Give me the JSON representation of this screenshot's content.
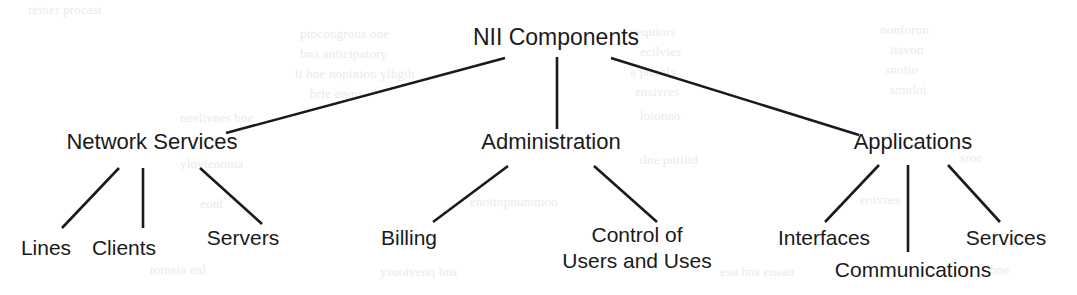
{
  "diagram": {
    "title": "NII Components",
    "type": "tree",
    "orientation": "top-down",
    "background_color": "#ffffff",
    "text_color": "#1a1a1a",
    "edge_color": "#1a1a1a",
    "root": {
      "id": "nii-components",
      "label": "NII Components",
      "x": 556,
      "y": 37
    },
    "branches": [
      {
        "id": "network-services",
        "label": "Network Services",
        "x": 152,
        "y": 142,
        "children": [
          {
            "id": "lines",
            "label": "Lines",
            "x": 46,
            "y": 248
          },
          {
            "id": "clients",
            "label": "Clients",
            "x": 124,
            "y": 248
          },
          {
            "id": "servers",
            "label": "Servers",
            "x": 243,
            "y": 238
          }
        ]
      },
      {
        "id": "administration",
        "label": "Administration",
        "x": 551,
        "y": 142,
        "children": [
          {
            "id": "billing",
            "label": "Billing",
            "x": 409,
            "y": 238
          },
          {
            "id": "control-of-users-and-uses",
            "label": "Control of Users and Uses",
            "lines": [
              "Control of",
              "Users and Uses"
            ],
            "x": 637,
            "y": 248
          }
        ]
      },
      {
        "id": "applications",
        "label": "Applications",
        "x": 913,
        "y": 142,
        "children": [
          {
            "id": "interfaces",
            "label": "Interfaces",
            "x": 824,
            "y": 238
          },
          {
            "id": "communications",
            "label": "Communications",
            "x": 913,
            "y": 270
          },
          {
            "id": "services",
            "label": "Services",
            "x": 1006,
            "y": 238
          }
        ]
      }
    ],
    "edges": [
      {
        "id": "edge-root-network-services",
        "from": "nii-components",
        "to": "network-services",
        "x1": 505,
        "y1": 58,
        "x2": 226,
        "y2": 133
      },
      {
        "id": "edge-root-administration",
        "from": "nii-components",
        "to": "administration",
        "x1": 557,
        "y1": 57,
        "x2": 557,
        "y2": 129
      },
      {
        "id": "edge-root-applications",
        "from": "nii-components",
        "to": "applications",
        "x1": 611,
        "y1": 58,
        "x2": 859,
        "y2": 135
      },
      {
        "id": "edge-network-services-lines",
        "from": "network-services",
        "to": "lines",
        "x1": 119,
        "y1": 168,
        "x2": 62,
        "y2": 228
      },
      {
        "id": "edge-network-services-clients",
        "from": "network-services",
        "to": "clients",
        "x1": 143,
        "y1": 168,
        "x2": 143,
        "y2": 228
      },
      {
        "id": "edge-network-services-servers",
        "from": "network-services",
        "to": "servers",
        "x1": 200,
        "y1": 168,
        "x2": 262,
        "y2": 224
      },
      {
        "id": "edge-administration-billing",
        "from": "administration",
        "to": "billing",
        "x1": 508,
        "y1": 166,
        "x2": 433,
        "y2": 222
      },
      {
        "id": "edge-administration-control",
        "from": "administration",
        "to": "control-of-users-and-uses",
        "x1": 594,
        "y1": 166,
        "x2": 657,
        "y2": 222
      },
      {
        "id": "edge-applications-interfaces",
        "from": "applications",
        "to": "interfaces",
        "x1": 879,
        "y1": 165,
        "x2": 825,
        "y2": 222
      },
      {
        "id": "edge-applications-communications",
        "from": "applications",
        "to": "communications",
        "x1": 908,
        "y1": 165,
        "x2": 908,
        "y2": 252
      },
      {
        "id": "edge-applications-services",
        "from": "applications",
        "to": "services",
        "x1": 948,
        "y1": 165,
        "x2": 1000,
        "y2": 222
      }
    ]
  },
  "background_ghost_text": [
    {
      "text": "reiner procast",
      "x": 28,
      "y": 2
    },
    {
      "text": "ptocongrous one",
      "x": 300,
      "y": 26
    },
    {
      "text": "e nequiors",
      "x": 620,
      "y": 24
    },
    {
      "text": "nonforon",
      "x": 880,
      "y": 22
    },
    {
      "text": "bna anticipatory",
      "x": 300,
      "y": 46
    },
    {
      "text": "ecilvies",
      "x": 640,
      "y": 44
    },
    {
      "text": "itavon",
      "x": 890,
      "y": 42
    },
    {
      "text": "li bne nopinion ylhgih",
      "x": 295,
      "y": 66
    },
    {
      "text": "a pnnoly",
      "x": 630,
      "y": 64
    },
    {
      "text": "snotio",
      "x": 885,
      "y": 62
    },
    {
      "text": "brie enov",
      "x": 310,
      "y": 86
    },
    {
      "text": "ensivres",
      "x": 635,
      "y": 84
    },
    {
      "text": "smuloi",
      "x": 890,
      "y": 82
    },
    {
      "text": "neelivnes bne",
      "x": 180,
      "y": 110
    },
    {
      "text": "loionao",
      "x": 640,
      "y": 108
    },
    {
      "text": "ylovienoma",
      "x": 180,
      "y": 156
    },
    {
      "text": "dne pniiiid",
      "x": 640,
      "y": 152
    },
    {
      "text": "sroe",
      "x": 960,
      "y": 150
    },
    {
      "text": "eonl",
      "x": 200,
      "y": 196
    },
    {
      "text": "enoitopnummoo",
      "x": 470,
      "y": 194
    },
    {
      "text": "eoivnes",
      "x": 860,
      "y": 192
    },
    {
      "text": "toinsia enl",
      "x": 150,
      "y": 262
    },
    {
      "text": "ysuoivenq bns",
      "x": 380,
      "y": 264
    },
    {
      "text": "esu bns ensau",
      "x": 720,
      "y": 264
    },
    {
      "text": "bne",
      "x": 990,
      "y": 262
    }
  ]
}
